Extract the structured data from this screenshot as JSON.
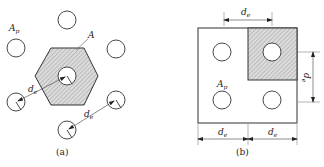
{
  "figure": {
    "panels": [
      {
        "id": "a",
        "caption": "(a)",
        "description": "Hexagonal (triangular) arrangement of bolt/pipe holes with shaded hexagonal tributary area",
        "labels": {
          "pore_area": {
            "main": "A",
            "sub": "p"
          },
          "tributary_area": {
            "main": "A",
            "sub": ""
          },
          "spacing_1": {
            "main": "d",
            "sub": "e"
          },
          "spacing_2": {
            "main": "d",
            "sub": "e"
          }
        }
      },
      {
        "id": "b",
        "caption": "(b)",
        "description": "Square arrangement of holes with shaded square tributary area",
        "labels": {
          "pore_area": {
            "main": "A",
            "sub": "p"
          },
          "top_dim": {
            "main": "d",
            "sub": "e"
          },
          "right_dim": {
            "main": "d",
            "sub": "e"
          },
          "bottom_left_dim": {
            "main": "d",
            "sub": "e"
          },
          "bottom_right_dim": {
            "main": "d",
            "sub": "e"
          }
        }
      }
    ],
    "colors": {
      "stroke": "#333333",
      "hatch_fill": "#d9d9d9",
      "hatch_line": "#8a8a8a",
      "background": "#ffffff"
    }
  }
}
